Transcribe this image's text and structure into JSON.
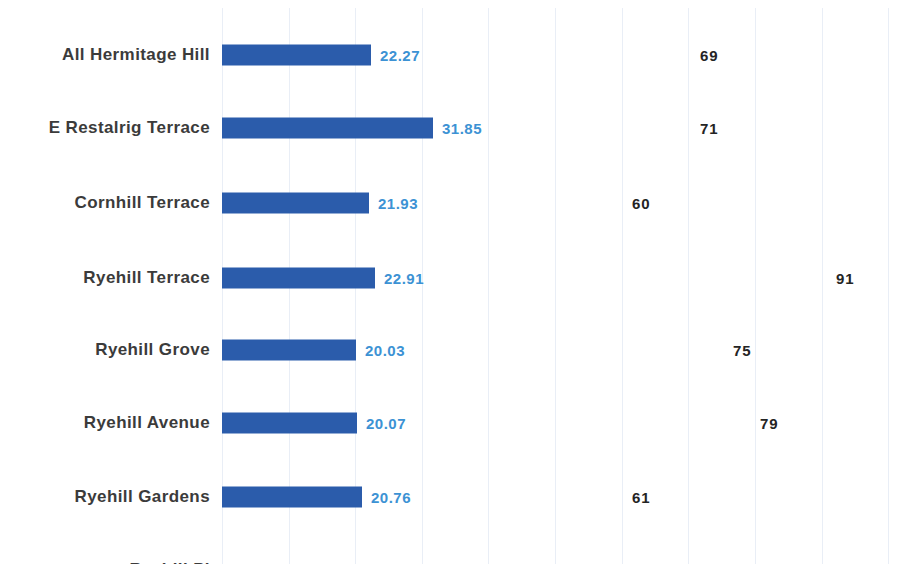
{
  "chart": {
    "title": "",
    "type": "bar"
  },
  "chart_data": {
    "type": "bar",
    "orientation": "horizontal",
    "title": "",
    "subtitle": "",
    "xlabel": "",
    "ylabel": "",
    "grid": true,
    "gridline_x": [
      222,
      289,
      355,
      422,
      488,
      555,
      622,
      688,
      755,
      822,
      888
    ],
    "legend": [],
    "legend_position": "none",
    "categories": [
      "All Hermitage Hill",
      "E Restalrig Terrace",
      "Cornhill  Terrace",
      "Ryehill Terrace",
      "Ryehill Grove",
      "Ryehill Avenue",
      "Ryehill Gardens",
      "Ryehill Pl"
    ],
    "series": [
      {
        "name": "bar value",
        "color": "#2b5cab",
        "label_color": "#3c92d4",
        "values": [
          22.27,
          31.85,
          21.93,
          22.91,
          20.03,
          20.07,
          20.76,
          null
        ],
        "value_labels": [
          "22.27",
          "31.85",
          "21.93",
          "22.91",
          "20.03",
          "20.07",
          "20.76",
          ""
        ]
      },
      {
        "name": "count",
        "color": "#242424",
        "values": [
          69,
          71,
          60,
          91,
          75,
          79,
          61,
          59
        ],
        "value_labels": [
          "69",
          "71",
          "60",
          "91",
          "75",
          "79",
          "61",
          "59"
        ]
      }
    ],
    "xlim": [
      0,
      100
    ],
    "note": "Counts are plotted as standalone numeric labels positioned along the same horizontal axis as the bars; the bottom row 'Ryehill Pl' (59) is clipped by the bottom edge of the screenshot."
  },
  "rows": [
    {
      "label": "All Hermitage Hill",
      "value": "22.27",
      "bar_width_px": 149,
      "count": "69",
      "count_x": 700,
      "top": 35
    },
    {
      "label": "E Restalrig Terrace",
      "value": "31.85",
      "bar_width_px": 211,
      "count": "71",
      "count_x": 700,
      "top": 108
    },
    {
      "label": "Cornhill  Terrace",
      "value": "21.93",
      "bar_width_px": 147,
      "count": "60",
      "count_x": 632,
      "top": 183
    },
    {
      "label": "Ryehill Terrace",
      "value": "22.91",
      "bar_width_px": 153,
      "count": "91",
      "count_x": 836,
      "top": 258
    },
    {
      "label": "Ryehill Grove",
      "value": "20.03",
      "bar_width_px": 134,
      "count": "75",
      "count_x": 733,
      "top": 330
    },
    {
      "label": "Ryehill Avenue",
      "value": "20.07",
      "bar_width_px": 135,
      "count": "79",
      "count_x": 760,
      "top": 403
    },
    {
      "label": "Ryehill Gardens",
      "value": "20.76",
      "bar_width_px": 140,
      "count": "61",
      "count_x": 632,
      "top": 477
    },
    {
      "label": "Ryehill Pl",
      "value": "",
      "bar_width_px": 0,
      "count": "59",
      "count_x": 632,
      "top": 550
    }
  ]
}
